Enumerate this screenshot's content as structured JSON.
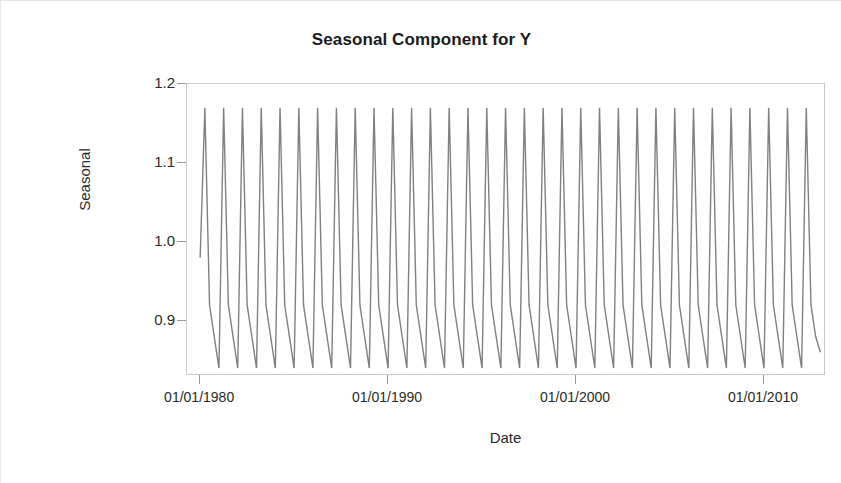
{
  "chart_data": {
    "type": "line",
    "title": "Seasonal Component for Y",
    "xlabel": "Date",
    "ylabel": "Seasonal",
    "grid": false,
    "legend": null,
    "line_color": "#808080",
    "ylim": [
      0.83,
      1.2
    ],
    "ytick_labels": [
      "1.2",
      "1.1",
      "1.0",
      "0.9"
    ],
    "ytick_values": [
      1.2,
      1.1,
      1.0,
      0.9
    ],
    "xtick_labels": [
      "01/01/1980",
      "01/01/1990",
      "01/01/2000",
      "01/01/2010"
    ],
    "xtick_values": [
      1980.0,
      1990.0,
      2000.0,
      2010.0
    ],
    "xlim": [
      1979.3,
      2013.3
    ],
    "peak_value": 1.17,
    "trough_value": 0.84,
    "period_years": 1,
    "x": [
      1980.0,
      1980.25,
      1980.5,
      1980.75,
      1981.0,
      1981.25,
      1981.5,
      1981.75,
      1982.0,
      1982.25,
      1982.5,
      1982.75,
      1983.0,
      1983.25,
      1983.5,
      1983.75,
      1984.0,
      1984.25,
      1984.5,
      1984.75,
      1985.0,
      1985.25,
      1985.5,
      1985.75,
      1986.0,
      1986.25,
      1986.5,
      1986.75,
      1987.0,
      1987.25,
      1987.5,
      1987.75,
      1988.0,
      1988.25,
      1988.5,
      1988.75,
      1989.0,
      1989.25,
      1989.5,
      1989.75,
      1990.0,
      1990.25,
      1990.5,
      1990.75,
      1991.0,
      1991.25,
      1991.5,
      1991.75,
      1992.0,
      1992.25,
      1992.5,
      1992.75,
      1993.0,
      1993.25,
      1993.5,
      1993.75,
      1994.0,
      1994.25,
      1994.5,
      1994.75,
      1995.0,
      1995.25,
      1995.5,
      1995.75,
      1996.0,
      1996.25,
      1996.5,
      1996.75,
      1997.0,
      1997.25,
      1997.5,
      1997.75,
      1998.0,
      1998.25,
      1998.5,
      1998.75,
      1999.0,
      1999.25,
      1999.5,
      1999.75,
      2000.0,
      2000.25,
      2000.5,
      2000.75,
      2001.0,
      2001.25,
      2001.5,
      2001.75,
      2002.0,
      2002.25,
      2002.5,
      2002.75,
      2003.0,
      2003.25,
      2003.5,
      2003.75,
      2004.0,
      2004.25,
      2004.5,
      2004.75,
      2005.0,
      2005.25,
      2005.5,
      2005.75,
      2006.0,
      2006.25,
      2006.5,
      2006.75,
      2007.0,
      2007.25,
      2007.5,
      2007.75,
      2008.0,
      2008.25,
      2008.5,
      2008.75,
      2009.0,
      2009.25,
      2009.5,
      2009.75,
      2010.0,
      2010.25,
      2010.5,
      2010.75,
      2011.0,
      2011.25,
      2011.5,
      2011.75,
      2012.0,
      2012.25,
      2012.5,
      2012.75,
      2013.0
    ],
    "values": [
      0.98,
      1.17,
      0.92,
      0.88,
      0.84,
      1.17,
      0.92,
      0.88,
      0.84,
      1.17,
      0.92,
      0.88,
      0.84,
      1.17,
      0.92,
      0.88,
      0.84,
      1.17,
      0.92,
      0.88,
      0.84,
      1.17,
      0.92,
      0.88,
      0.84,
      1.17,
      0.92,
      0.88,
      0.84,
      1.17,
      0.92,
      0.88,
      0.84,
      1.17,
      0.92,
      0.88,
      0.84,
      1.17,
      0.92,
      0.88,
      0.84,
      1.17,
      0.92,
      0.88,
      0.84,
      1.17,
      0.92,
      0.88,
      0.84,
      1.17,
      0.92,
      0.88,
      0.84,
      1.17,
      0.92,
      0.88,
      0.84,
      1.17,
      0.92,
      0.88,
      0.84,
      1.17,
      0.92,
      0.88,
      0.84,
      1.17,
      0.92,
      0.88,
      0.84,
      1.17,
      0.92,
      0.88,
      0.84,
      1.17,
      0.92,
      0.88,
      0.84,
      1.17,
      0.92,
      0.88,
      0.84,
      1.17,
      0.92,
      0.88,
      0.84,
      1.17,
      0.92,
      0.88,
      0.84,
      1.17,
      0.92,
      0.88,
      0.84,
      1.17,
      0.92,
      0.88,
      0.84,
      1.17,
      0.92,
      0.88,
      0.84,
      1.17,
      0.92,
      0.88,
      0.84,
      1.17,
      0.92,
      0.88,
      0.84,
      1.17,
      0.92,
      0.88,
      0.84,
      1.17,
      0.92,
      0.88,
      0.84,
      1.17,
      0.92,
      0.88,
      0.84,
      1.17,
      0.92,
      0.88,
      0.84,
      1.17,
      0.92,
      0.88,
      0.84,
      1.17,
      0.92,
      0.88,
      0.86
    ]
  }
}
